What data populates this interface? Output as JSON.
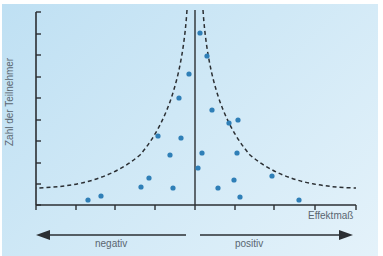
{
  "chart_data": {
    "type": "scatter",
    "subtype": "funnel_plot",
    "title": "",
    "xlabel": "Effektmaß",
    "ylabel": "Zahl der Teilnehmer",
    "direction_labels": {
      "left": "negativ",
      "right": "positiv"
    },
    "x_ticks_px": [
      36,
      76,
      115,
      155,
      195,
      235,
      274,
      315,
      356
    ],
    "y_ticks_px": [
      12,
      34,
      55,
      77,
      98,
      120,
      141,
      163,
      184,
      205
    ],
    "center_line_x_px": 195,
    "grid": false,
    "tick_labels_shown": false,
    "points_px": [
      {
        "x": 200,
        "y": 33
      },
      {
        "x": 207,
        "y": 56
      },
      {
        "x": 189,
        "y": 74
      },
      {
        "x": 179,
        "y": 98
      },
      {
        "x": 212,
        "y": 110
      },
      {
        "x": 238,
        "y": 120
      },
      {
        "x": 229,
        "y": 123
      },
      {
        "x": 158,
        "y": 136
      },
      {
        "x": 181,
        "y": 138
      },
      {
        "x": 170,
        "y": 155
      },
      {
        "x": 202,
        "y": 153
      },
      {
        "x": 237,
        "y": 153
      },
      {
        "x": 198,
        "y": 168
      },
      {
        "x": 149,
        "y": 178
      },
      {
        "x": 234,
        "y": 180
      },
      {
        "x": 272,
        "y": 176
      },
      {
        "x": 141,
        "y": 187
      },
      {
        "x": 173,
        "y": 188
      },
      {
        "x": 218,
        "y": 188
      },
      {
        "x": 240,
        "y": 197
      },
      {
        "x": 101,
        "y": 196
      },
      {
        "x": 88,
        "y": 200
      },
      {
        "x": 299,
        "y": 200
      }
    ],
    "funnel_bounds": "dashed curves symmetric about center line; narrow at top (large samples), wide at bottom (small samples)"
  },
  "labels": {
    "ylabel": "Zahl der Teilnehmer",
    "xlabel": "Effektmaß",
    "negative": "negativ",
    "positive": "positiv"
  },
  "colors": {
    "background": "#cfe8f6",
    "axis": "#2b2f33",
    "point": "#2f7fb7",
    "text": "#5a6670"
  }
}
